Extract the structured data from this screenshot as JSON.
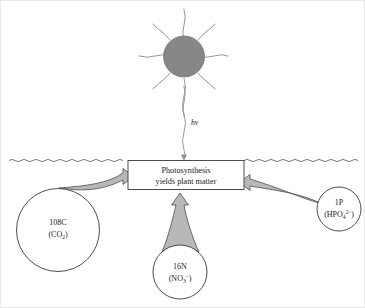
{
  "figure": {
    "colors": {
      "sun_fill": "#878787",
      "arrow_fill": "#b8b8b8",
      "stroke": "#4d4d4d",
      "text": "#1a1a1a",
      "background": "#ffffff"
    }
  },
  "sun": {
    "name": "sun",
    "ray_count": 8
  },
  "photon": {
    "label": "h",
    "symbol": "ν",
    "ray_name": "light-ray"
  },
  "water_surface": {
    "name": "water-surface-line"
  },
  "process_box": {
    "line1": "Photosynthesis",
    "line2": "yields plant matter"
  },
  "nutrients": [
    {
      "id": "carbon",
      "quantity": "108C",
      "formula_open": "(CO",
      "formula_sub": "2",
      "formula_close": ")",
      "arrow_direction": "right"
    },
    {
      "id": "nitrogen",
      "quantity": "16N",
      "formula_open": "(NO",
      "formula_sub": "3",
      "formula_sup": "−",
      "formula_close": ")",
      "arrow_direction": "up"
    },
    {
      "id": "phosphorus",
      "quantity": "1P",
      "formula_open": "(HPO",
      "formula_sub": "4",
      "formula_sup": "2−",
      "formula_close": ")",
      "arrow_direction": "left"
    }
  ]
}
